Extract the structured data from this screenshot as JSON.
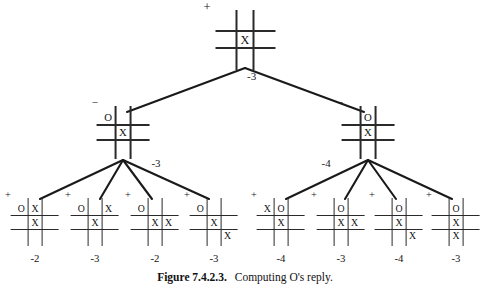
{
  "figure": {
    "caption_label": "Figure 7.4.2.3.",
    "caption_text": "Computing O's reply.",
    "width": 490,
    "height": 292,
    "ink_color": "#1a1a1a",
    "background_color": "#ffffff"
  },
  "tree": {
    "root": {
      "id": "root",
      "sign": "+",
      "value": "-3",
      "board": [
        "",
        "",
        "",
        "",
        "X",
        "",
        "",
        "",
        ""
      ],
      "x": 245,
      "y": 14,
      "scale": 1.0
    },
    "level2": [
      {
        "id": "n-left",
        "sign": "−",
        "value": "-3",
        "board": [
          "O",
          "",
          "",
          "",
          "X",
          "",
          "",
          "",
          ""
        ],
        "x": 123,
        "y": 110,
        "scale": 0.88
      },
      {
        "id": "n-right",
        "sign": "−",
        "value": "-4",
        "board": [
          "",
          "O",
          "",
          "",
          "X",
          "",
          "",
          "",
          ""
        ],
        "x": 368,
        "y": 110,
        "scale": 0.88
      }
    ],
    "leaves": [
      {
        "id": "leaf-1",
        "sign": "+",
        "value": "-2",
        "board": [
          "O",
          "X",
          "",
          "",
          "X",
          "",
          "",
          "",
          ""
        ],
        "x": 35,
        "y": 202,
        "scale": 0.8
      },
      {
        "id": "leaf-2",
        "sign": "+",
        "value": "-3",
        "board": [
          "O",
          "",
          "X",
          "",
          "X",
          "",
          "",
          "",
          ""
        ],
        "x": 95,
        "y": 202,
        "scale": 0.8
      },
      {
        "id": "leaf-3",
        "sign": "+",
        "value": "-2",
        "board": [
          "O",
          "",
          "",
          "",
          "X",
          "X",
          "",
          "",
          ""
        ],
        "x": 155,
        "y": 202,
        "scale": 0.8
      },
      {
        "id": "leaf-4",
        "sign": "+",
        "value": "-3",
        "board": [
          "O",
          "",
          "",
          "",
          "X",
          "",
          "",
          "",
          "X"
        ],
        "x": 214,
        "y": 202,
        "scale": 0.8
      },
      {
        "id": "leaf-5",
        "sign": "+",
        "value": "-4",
        "board": [
          "X",
          "O",
          "",
          "",
          "X",
          "",
          "",
          "",
          ""
        ],
        "x": 281,
        "y": 202,
        "scale": 0.8
      },
      {
        "id": "leaf-6",
        "sign": "+",
        "value": "-3",
        "board": [
          "",
          "O",
          "",
          "",
          "X",
          "X",
          "",
          "",
          ""
        ],
        "x": 341,
        "y": 202,
        "scale": 0.8
      },
      {
        "id": "leaf-7",
        "sign": "+",
        "value": "-4",
        "board": [
          "",
          "O",
          "",
          "",
          "X",
          "",
          "",
          "",
          "X"
        ],
        "x": 399,
        "y": 202,
        "scale": 0.8
      },
      {
        "id": "leaf-8",
        "sign": "+",
        "value": "-3",
        "board": [
          "",
          "O",
          "",
          "",
          "X",
          "",
          "",
          "X",
          ""
        ],
        "x": 456,
        "y": 202,
        "scale": 0.8
      }
    ],
    "edges": [
      {
        "from": "root",
        "to": "n-left",
        "x1": 245,
        "y1": 68,
        "x2": 127,
        "y2": 112
      },
      {
        "from": "root",
        "to": "n-right",
        "x1": 245,
        "y1": 68,
        "x2": 364,
        "y2": 112
      },
      {
        "from": "n-left",
        "to": "leaf-1",
        "x1": 123,
        "y1": 160,
        "x2": 40,
        "y2": 199
      },
      {
        "from": "n-left",
        "to": "leaf-2",
        "x1": 123,
        "y1": 160,
        "x2": 100,
        "y2": 199
      },
      {
        "from": "n-left",
        "to": "leaf-3",
        "x1": 123,
        "y1": 160,
        "x2": 152,
        "y2": 199
      },
      {
        "from": "n-left",
        "to": "leaf-4",
        "x1": 123,
        "y1": 160,
        "x2": 209,
        "y2": 199
      },
      {
        "from": "n-right",
        "to": "leaf-5",
        "x1": 368,
        "y1": 160,
        "x2": 286,
        "y2": 199
      },
      {
        "from": "n-right",
        "to": "leaf-6",
        "x1": 368,
        "y1": 160,
        "x2": 345,
        "y2": 199
      },
      {
        "from": "n-right",
        "to": "leaf-7",
        "x1": 368,
        "y1": 160,
        "x2": 396,
        "y2": 199
      },
      {
        "from": "n-right",
        "to": "leaf-8",
        "x1": 368,
        "y1": 160,
        "x2": 452,
        "y2": 199
      }
    ]
  }
}
